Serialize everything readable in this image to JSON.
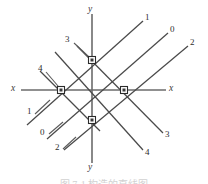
{
  "figure": {
    "type": "geometry-diagram",
    "background_color": "#ffffff",
    "line_color": "#4a4a4a",
    "axis_color": "#6b6b6b",
    "node_fill": "#ffffff",
    "node_stroke": "#2b2b2b",
    "width": 208,
    "height": 184
  },
  "axes": {
    "x_left_label": "x",
    "x_right_label": "x",
    "y_top_label": "y",
    "y_bottom_label": "y"
  },
  "labels": {
    "upper_left_4": "4",
    "upper_center_3": "3",
    "upper_right_1": "1",
    "upper_right_0": "0",
    "upper_right_2": "2",
    "lower_left_1": "1",
    "lower_left_0": "0",
    "lower_left_2": "2",
    "lower_right_3": "3",
    "lower_right_4": "4"
  },
  "nodes": [
    {
      "name": "node-top",
      "x": 92,
      "y": 60
    },
    {
      "name": "node-left",
      "x": 61,
      "y": 90
    },
    {
      "name": "node-right",
      "x": 124,
      "y": 90
    },
    {
      "name": "node-bottom",
      "x": 92,
      "y": 120
    }
  ],
  "caption": {
    "text": "图 7-1  构造的直线图"
  }
}
